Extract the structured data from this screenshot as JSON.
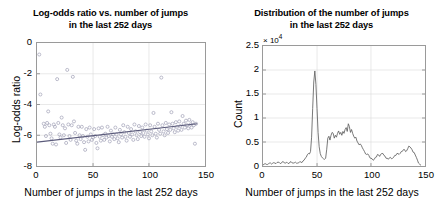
{
  "figure": {
    "background": "#ffffff",
    "axis_color": "#9a9a9a",
    "grid_color": "#d9d9d9",
    "marker_color": "#9f9fb5",
    "line_color": "#5a5a7a",
    "curve_color": "#5f5f5f"
  },
  "panels": [
    {
      "id": "left",
      "title_line1": "Log-odds ratio vs. number of jumps",
      "title_line2": "in the last 252 days",
      "xlabel": "Number of jumps in the last 252 days",
      "ylabel": "Log-odds ratio",
      "xticks": [
        "0",
        "50",
        "100",
        "150"
      ],
      "yticks": [
        "0",
        "-2",
        "-4",
        "-6",
        "-8"
      ]
    },
    {
      "id": "right",
      "title_line1": "Distribution of the number of jumps",
      "title_line2": "in the last 252 days",
      "xlabel": "Number of jumps in the last 252 days",
      "ylabel": "Count",
      "exponent": "× 10",
      "exponent_power": "4",
      "xticks": [
        "0",
        "50",
        "100",
        "150"
      ],
      "yticks": [
        "0",
        "0.5",
        "1",
        "1.5",
        "2",
        "2.5"
      ]
    }
  ],
  "chart_data": [
    {
      "type": "scatter",
      "title": "Log-odds ratio vs. number of jumps in the last 252 days",
      "xlabel": "Number of jumps in the last 252 days",
      "ylabel": "Log-odds ratio",
      "xlim": [
        0,
        150
      ],
      "ylim": [
        -8,
        0
      ],
      "xticks": [
        0,
        50,
        100,
        150
      ],
      "yticks": [
        0,
        -2,
        -4,
        -6,
        -8
      ],
      "grid": true,
      "legend": null,
      "marker": "open-circle",
      "points": [
        [
          2,
          -0.75
        ],
        [
          3,
          -3.35
        ],
        [
          6,
          -5.25
        ],
        [
          7,
          -5.45
        ],
        [
          8,
          -6.05
        ],
        [
          9,
          -5.2
        ],
        [
          10,
          -4.45
        ],
        [
          11,
          -5.35
        ],
        [
          12,
          -5.9
        ],
        [
          13,
          -6.2
        ],
        [
          14,
          -6.55
        ],
        [
          15,
          -5.3
        ],
        [
          16,
          -5.45
        ],
        [
          17,
          -6.6
        ],
        [
          18,
          -2.35
        ],
        [
          19,
          -5.2
        ],
        [
          20,
          -5.95
        ],
        [
          21,
          -6.15
        ],
        [
          22,
          -4.85
        ],
        [
          23,
          -5.35
        ],
        [
          24,
          -6.0
        ],
        [
          25,
          -5.55
        ],
        [
          26,
          -6.5
        ],
        [
          27,
          -1.75
        ],
        [
          28,
          -5.3
        ],
        [
          29,
          -6.05
        ],
        [
          30,
          -6.3
        ],
        [
          31,
          -5.35
        ],
        [
          32,
          -2.2
        ],
        [
          33,
          -5.1
        ],
        [
          34,
          -5.85
        ],
        [
          35,
          -6.35
        ],
        [
          36,
          -6.55
        ],
        [
          37,
          -5.45
        ],
        [
          38,
          -6.0
        ],
        [
          39,
          -6.25
        ],
        [
          40,
          -5.45
        ],
        [
          41,
          -6.05
        ],
        [
          42,
          -6.45
        ],
        [
          43,
          -6.95
        ],
        [
          44,
          -5.6
        ],
        [
          45,
          -6.1
        ],
        [
          46,
          -6.4
        ],
        [
          47,
          -5.5
        ],
        [
          48,
          -5.95
        ],
        [
          49,
          -6.3
        ],
        [
          50,
          -6.15
        ],
        [
          51,
          -5.6
        ],
        [
          52,
          -6.05
        ],
        [
          53,
          -6.5
        ],
        [
          54,
          -6.85
        ],
        [
          55,
          -5.55
        ],
        [
          56,
          -6.1
        ],
        [
          57,
          -6.35
        ],
        [
          58,
          -5.5
        ],
        [
          59,
          -6.0
        ],
        [
          60,
          -6.3
        ],
        [
          61,
          -5.9
        ],
        [
          62,
          -6.15
        ],
        [
          63,
          -5.45
        ],
        [
          64,
          -6.05
        ],
        [
          65,
          -6.4
        ],
        [
          66,
          -5.7
        ],
        [
          67,
          -6.1
        ],
        [
          68,
          -5.95
        ],
        [
          69,
          -6.25
        ],
        [
          70,
          -5.5
        ],
        [
          71,
          -5.95
        ],
        [
          72,
          -6.2
        ],
        [
          73,
          -6.45
        ],
        [
          74,
          -5.65
        ],
        [
          75,
          -5.95
        ],
        [
          76,
          -6.15
        ],
        [
          77,
          -5.35
        ],
        [
          78,
          -5.8
        ],
        [
          79,
          -6.1
        ],
        [
          80,
          -6.35
        ],
        [
          81,
          -5.45
        ],
        [
          82,
          -5.85
        ],
        [
          83,
          -6.1
        ],
        [
          84,
          -5.6
        ],
        [
          85,
          -5.95
        ],
        [
          86,
          -6.3
        ],
        [
          87,
          -5.3
        ],
        [
          88,
          -5.75
        ],
        [
          89,
          -6.0
        ],
        [
          90,
          -6.25
        ],
        [
          91,
          -5.4
        ],
        [
          92,
          -5.8
        ],
        [
          93,
          -6.05
        ],
        [
          94,
          -5.5
        ],
        [
          95,
          -5.85
        ],
        [
          96,
          -6.1
        ],
        [
          97,
          -5.3
        ],
        [
          98,
          -5.7
        ],
        [
          99,
          -5.95
        ],
        [
          100,
          -6.2
        ],
        [
          101,
          -5.35
        ],
        [
          102,
          -5.75
        ],
        [
          103,
          -6.0
        ],
        [
          104,
          -4.55
        ],
        [
          105,
          -5.45
        ],
        [
          106,
          -5.9
        ],
        [
          107,
          -6.15
        ],
        [
          108,
          -5.25
        ],
        [
          109,
          -5.65
        ],
        [
          110,
          -5.9
        ],
        [
          111,
          -2.25
        ],
        [
          112,
          -5.35
        ],
        [
          113,
          -5.75
        ],
        [
          114,
          -6.0
        ],
        [
          115,
          -5.2
        ],
        [
          116,
          -5.6
        ],
        [
          117,
          -5.85
        ],
        [
          118,
          -5.3
        ],
        [
          119,
          -5.65
        ],
        [
          120,
          -4.5
        ],
        [
          121,
          -5.25
        ],
        [
          122,
          -5.55
        ],
        [
          123,
          -5.8
        ],
        [
          124,
          -5.15
        ],
        [
          125,
          -5.45
        ],
        [
          126,
          -5.7
        ],
        [
          127,
          -5.1
        ],
        [
          128,
          -5.4
        ],
        [
          129,
          -5.65
        ],
        [
          130,
          -4.75
        ],
        [
          131,
          -5.25
        ],
        [
          132,
          -5.5
        ],
        [
          133,
          -5.05
        ],
        [
          134,
          -5.35
        ],
        [
          135,
          -5.55
        ],
        [
          136,
          -5.0
        ],
        [
          137,
          -5.3
        ],
        [
          138,
          -5.5
        ],
        [
          139,
          -5.15
        ],
        [
          140,
          -5.35
        ],
        [
          141,
          -6.55
        ],
        [
          142,
          -5.25
        ]
      ],
      "fit_line": {
        "x": [
          0,
          143
        ],
        "y": [
          -6.45,
          -5.25
        ],
        "style": "solid"
      }
    },
    {
      "type": "line",
      "title": "Distribution of the number of jumps in the last 252 days",
      "xlabel": "Number of jumps in the last 252 days",
      "ylabel": "Count",
      "y_exponent": 10000,
      "xlim": [
        0,
        150
      ],
      "ylim": [
        0,
        25000
      ],
      "xticks": [
        0,
        50,
        100,
        150
      ],
      "yticks": [
        0,
        5000,
        10000,
        15000,
        20000,
        25000
      ],
      "ytick_labels": [
        "0",
        "0.5",
        "1",
        "1.5",
        "2",
        "2.5"
      ],
      "grid": true,
      "legend": null,
      "x": [
        0,
        2,
        4,
        6,
        8,
        10,
        12,
        14,
        16,
        18,
        20,
        22,
        24,
        26,
        28,
        30,
        32,
        34,
        36,
        38,
        40,
        42,
        44,
        45,
        46,
        47,
        48,
        49,
        50,
        51,
        52,
        53,
        54,
        55,
        56,
        57,
        58,
        59,
        60,
        61,
        62,
        63,
        64,
        65,
        66,
        67,
        68,
        69,
        70,
        71,
        72,
        73,
        74,
        75,
        76,
        77,
        78,
        79,
        80,
        81,
        82,
        83,
        84,
        85,
        86,
        87,
        88,
        89,
        90,
        92,
        94,
        96,
        98,
        100,
        102,
        104,
        106,
        108,
        110,
        112,
        114,
        116,
        118,
        120,
        122,
        124,
        126,
        128,
        130,
        132,
        134,
        136,
        138,
        140,
        142,
        144,
        146
      ],
      "values": [
        200,
        500,
        300,
        600,
        400,
        700,
        500,
        800,
        500,
        900,
        600,
        800,
        500,
        900,
        600,
        800,
        600,
        900,
        700,
        1200,
        1800,
        2600,
        3000,
        6000,
        12000,
        17500,
        19800,
        17000,
        12000,
        7000,
        4000,
        2600,
        2000,
        1700,
        1500,
        1400,
        1600,
        3500,
        5800,
        6200,
        5400,
        6400,
        7000,
        6800,
        5800,
        6400,
        6000,
        6800,
        7300,
        6600,
        7000,
        6400,
        7200,
        6800,
        7600,
        8000,
        7200,
        8800,
        8200,
        7000,
        7600,
        6800,
        6200,
        5800,
        6000,
        5200,
        4800,
        4400,
        4600,
        3800,
        3000,
        2400,
        2200,
        1600,
        1200,
        1800,
        2400,
        2000,
        2600,
        2200,
        1600,
        1400,
        1800,
        1600,
        2200,
        2600,
        2400,
        3000,
        3400,
        3000,
        3600,
        4000,
        3400,
        2800,
        1800,
        600,
        200
      ]
    }
  ]
}
